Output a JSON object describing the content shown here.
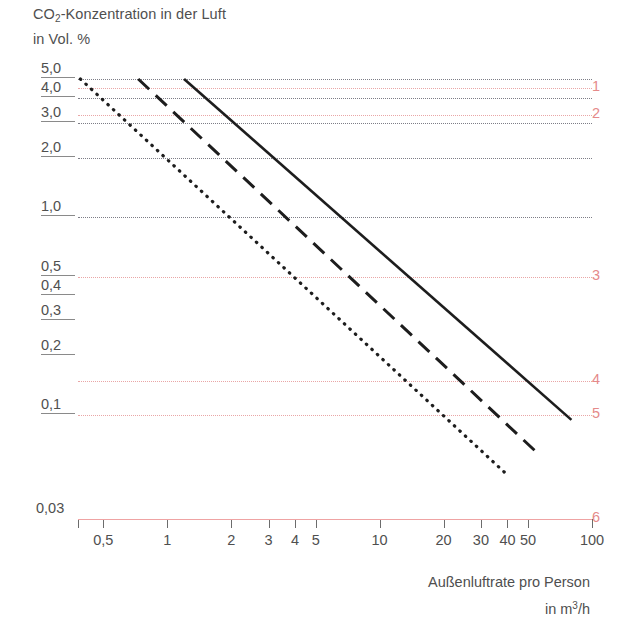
{
  "title": {
    "line1_prefix": "CO",
    "line1_sub": "2",
    "line1_rest": "-Konzentration in der Luft",
    "line2": "in Vol. %"
  },
  "axis_caption": {
    "line1": "Außenluftrate pro Person",
    "line2_prefix": "in m",
    "line2_sup": "3",
    "line2_rest": "/h"
  },
  "y_labels": [
    {
      "text": "5,0",
      "value": 5.0
    },
    {
      "text": "4,0",
      "value": 4.0
    },
    {
      "text": "3,0",
      "value": 3.0
    },
    {
      "text": "2,0",
      "value": 2.0
    },
    {
      "text": "1,0",
      "value": 1.0
    },
    {
      "text": "0,5",
      "value": 0.5
    },
    {
      "text": "0,4",
      "value": 0.4
    },
    {
      "text": "0,3",
      "value": 0.3
    },
    {
      "text": "0,2",
      "value": 0.2
    },
    {
      "text": "0,1",
      "value": 0.1
    },
    {
      "text": "0,03",
      "value": 0.03
    }
  ],
  "x_labels": [
    "0,5",
    "1",
    "2",
    "3",
    "4",
    "5",
    "10",
    "20",
    "30",
    "40",
    "50",
    "100"
  ],
  "right_labels": [
    "1",
    "2",
    "3",
    "4",
    "5",
    "6"
  ],
  "colors": {
    "red": "#e58a8a",
    "red_axis": "#efa3a3",
    "grid_dark": "#7d7d86",
    "text": "#4f4f4f",
    "curve": "#1d1d1d"
  },
  "chart_data": {
    "type": "line",
    "title": "CO2-Konzentration in der Luft in Vol. %",
    "xlabel": "Außenluftrate pro Person in m3/h",
    "ylabel": "CO2-Konzentration in der Luft in Vol. %",
    "xscale": "log",
    "yscale": "log",
    "xlim": [
      0.38,
      100
    ],
    "ylim": [
      0.03,
      5.0
    ],
    "grid": true,
    "legend": "none",
    "x_ticks": [
      0.5,
      1,
      2,
      3,
      4,
      5,
      10,
      20,
      30,
      40,
      50,
      100
    ],
    "y_ticks": [
      5.0,
      4.0,
      3.0,
      2.0,
      1.0,
      0.5,
      0.4,
      0.3,
      0.2,
      0.1,
      0.03
    ],
    "gridlines_dark_y": [
      5.0,
      4.0,
      3.0,
      2.0,
      1.0
    ],
    "gridlines_red_y": [
      4.5,
      3.3,
      0.5,
      0.15,
      0.1,
      0.03
    ],
    "right_axis_annotations": [
      {
        "label": "1",
        "y_value": 4.5
      },
      {
        "label": "2",
        "y_value": 3.3
      },
      {
        "label": "3",
        "y_value": 0.5
      },
      {
        "label": "4",
        "y_value": 0.15
      },
      {
        "label": "5",
        "y_value": 0.1
      },
      {
        "label": "6",
        "y_value": 0.03
      }
    ],
    "series": [
      {
        "name": "dotted",
        "style": "dotted",
        "points": [
          [
            0.39,
            5.0
          ],
          [
            40.0,
            0.05
          ]
        ]
      },
      {
        "name": "dashed",
        "style": "dashed",
        "points": [
          [
            0.73,
            5.0
          ],
          [
            55.0,
            0.065
          ]
        ]
      },
      {
        "name": "solid",
        "style": "solid",
        "points": [
          [
            1.2,
            5.0
          ],
          [
            80.0,
            0.095
          ]
        ]
      }
    ]
  }
}
